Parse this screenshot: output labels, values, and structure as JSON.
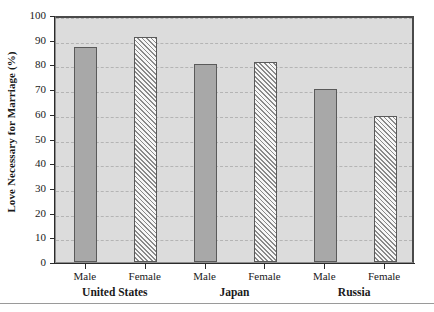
{
  "chart_data": {
    "type": "bar",
    "title": "",
    "xlabel": "",
    "ylabel": "Love Necessary for Marriage (%)",
    "ylim": [
      0,
      100
    ],
    "ytick_step": 10,
    "yticks": [
      0,
      10,
      20,
      30,
      40,
      50,
      60,
      70,
      80,
      90,
      100
    ],
    "ytick_labels": [
      "0",
      "10",
      "20",
      "30",
      "40",
      "50",
      "60",
      "70",
      "80",
      "90",
      "100"
    ],
    "grid": true,
    "grid_style": "dashed-horizontal",
    "legend": "none",
    "plot_background": "#dcdcdc",
    "categories": [
      "United States",
      "Japan",
      "Russia"
    ],
    "subcategories": [
      "Male",
      "Female"
    ],
    "series": [
      {
        "name": "Male",
        "style": "solid-gray",
        "color": "#a8a8a8",
        "values": [
          87,
          80,
          70
        ]
      },
      {
        "name": "Female",
        "style": "diagonal-hatch",
        "color": "#f2f2f2",
        "values": [
          91,
          81,
          59
        ]
      }
    ],
    "bars": [
      {
        "group": "United States",
        "subcategory": "Male",
        "value": 87,
        "style": "solid"
      },
      {
        "group": "United States",
        "subcategory": "Female",
        "value": 91,
        "style": "hatch"
      },
      {
        "group": "Japan",
        "subcategory": "Male",
        "value": 80,
        "style": "solid"
      },
      {
        "group": "Japan",
        "subcategory": "Female",
        "value": 81,
        "style": "hatch"
      },
      {
        "group": "Russia",
        "subcategory": "Male",
        "value": 70,
        "style": "solid"
      },
      {
        "group": "Russia",
        "subcategory": "Female",
        "value": 59,
        "style": "hatch"
      }
    ]
  }
}
